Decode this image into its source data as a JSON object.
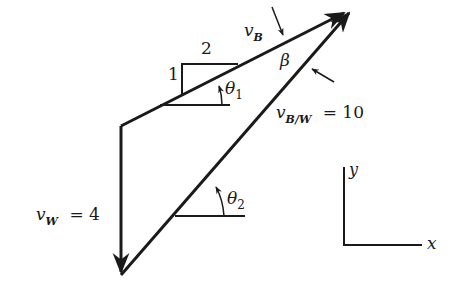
{
  "diagram": {
    "type": "vector-triangle",
    "stroke_color": "#1a1a1a",
    "vectors": [
      {
        "name": "v_B",
        "symbol": "v",
        "subscript": "B",
        "from": [
          121,
          126
        ],
        "to": [
          348,
          10
        ]
      },
      {
        "name": "v_W",
        "symbol": "v",
        "subscript": "W",
        "value": "4",
        "from": [
          121,
          126
        ],
        "to": [
          121,
          275
        ]
      },
      {
        "name": "v_B/W",
        "symbol": "v",
        "subscript": "B/W",
        "value": "10",
        "from": [
          121,
          275
        ],
        "to": [
          352,
          10
        ]
      }
    ],
    "labels": {
      "vB": {
        "v": "v",
        "sub": "B"
      },
      "vW": {
        "v": "v",
        "sub": "W",
        "eq": "= 4"
      },
      "vBW": {
        "v": "v",
        "sub": "B/W",
        "eq": "= 10"
      },
      "beta": "β",
      "theta1": {
        "sym": "θ",
        "sub": "1"
      },
      "theta2": {
        "sym": "θ",
        "sub": "2"
      },
      "slope_rise": "1",
      "slope_run": "2",
      "axis_x": "x",
      "axis_y": "y"
    }
  }
}
